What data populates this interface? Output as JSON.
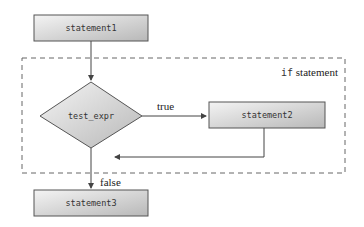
{
  "diagram": {
    "container_label_keyword": "if",
    "container_label_text": " statement",
    "nodes": {
      "statement1": "statement1",
      "test_expr": "test_expr",
      "statement2": "statement2",
      "statement3": "statement3"
    },
    "edges": {
      "true_label": "true",
      "false_label": "false"
    },
    "colors": {
      "box_fill_light": "#f2f2f2",
      "box_fill_dark": "#bdbdbd",
      "stroke": "#555555",
      "dash": "#666666"
    }
  }
}
